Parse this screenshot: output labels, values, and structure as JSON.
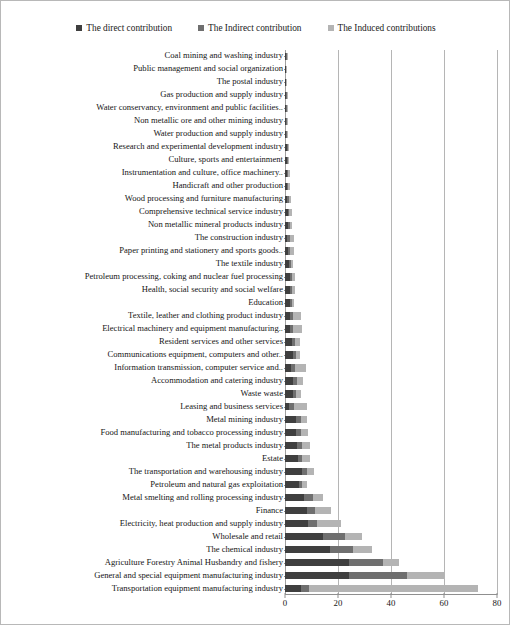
{
  "chart_data": {
    "type": "bar",
    "orientation": "horizontal",
    "stacked": true,
    "title": "",
    "xlabel": "",
    "ylabel": "",
    "xlim": [
      0,
      80
    ],
    "xticks": [
      0,
      20,
      40,
      60,
      80
    ],
    "grid": true,
    "legend_position": "top-center",
    "colors": {
      "direct": "#3f3f3f",
      "indirect": "#6f6f6f",
      "induced": "#b4b4b4",
      "gridline": "#b5b5b5",
      "axis": "#8f8f8f",
      "text": "#161616",
      "background": "#ffffff",
      "border": "#b8b8b8"
    },
    "series": [
      {
        "name": "The direct contribution",
        "key": "direct"
      },
      {
        "name": "The Indirect contribution",
        "key": "indirect"
      },
      {
        "name": "The Induced contributions",
        "key": "induced"
      }
    ],
    "categories": [
      "Coal mining and washing industry",
      "Public management and social organization",
      "The postal industry",
      "Gas production and supply industry",
      "Water conservancy, environment and public facilities..",
      "Non metallic ore and other mining industry",
      "Water production and supply industry",
      "Research and experimental development industry",
      "Culture, sports and entertainment",
      "Instrumentation and culture, office machinery..",
      "Handicraft and other production",
      "Wood processing and furniture manufacturing",
      "Comprehensive technical service industry",
      "Non metallic mineral products industry",
      "The construction industry",
      "Paper printing and stationery and sports goods..",
      "The textile industry",
      "Petroleum processing, coking and nuclear fuel processing",
      "Health, social security and social welfare",
      "Education",
      "Textile, leather and clothing product industry",
      "Electrical machinery and equipment manufacturing..",
      "Resident services and other services",
      "Communications equipment, computers and other..",
      "Information transmission, computer service and..",
      "Accommodation and catering industry",
      "Waste waste",
      "Leasing and business services",
      "Metal mining industry",
      "Food manufacturing and tobacco processing industry",
      "The metal products industry",
      "Estate",
      "The transportation and warehousing industry",
      "Petroleum and natural gas exploitation",
      "Metal smelting and rolling processing industry",
      "Finance",
      "Electricity, heat production and supply industry",
      "Wholesale and retail",
      "The chemical industry",
      "Agriculture Forestry Animal Husbandry and fishery",
      "General and special equipment manufacturing industry",
      "Transportation equipment manufacturing industry"
    ],
    "values": {
      "direct": [
        0.4,
        0.3,
        0.3,
        0.4,
        0.4,
        0.5,
        0.5,
        0.6,
        0.6,
        0.7,
        0.8,
        0.9,
        1.0,
        1.1,
        0.9,
        1.2,
        1.6,
        1.7,
        1.8,
        1.9,
        1.8,
        1.8,
        2.6,
        3.0,
        2.2,
        3.0,
        3.2,
        1.4,
        4.2,
        4.0,
        4.6,
        5.0,
        6.4,
        5.2,
        7.0,
        8.2,
        8.6,
        14.5,
        17.0,
        24.0,
        24.0,
        6.0
      ],
      "indirect": [
        0.2,
        0.2,
        0.2,
        0.2,
        0.3,
        0.3,
        0.3,
        0.4,
        0.5,
        0.5,
        0.5,
        0.6,
        0.6,
        0.7,
        0.9,
        0.8,
        0.7,
        0.9,
        0.8,
        0.6,
        1.1,
        1.3,
        1.0,
        1.2,
        1.6,
        1.4,
        1.0,
        2.0,
        1.8,
        2.2,
        2.0,
        1.6,
        2.0,
        1.2,
        3.6,
        3.2,
        3.6,
        8.0,
        8.6,
        13.0,
        22.0,
        3.0
      ],
      "induced": [
        0.2,
        0.2,
        0.2,
        0.3,
        0.4,
        0.4,
        0.5,
        0.5,
        0.6,
        0.7,
        0.7,
        0.8,
        0.9,
        1.0,
        1.6,
        1.3,
        0.9,
        1.0,
        1.1,
        0.9,
        3.0,
        3.2,
        2.0,
        1.6,
        4.0,
        2.4,
        2.0,
        4.8,
        2.4,
        2.6,
        2.8,
        3.0,
        2.6,
        1.8,
        3.6,
        6.0,
        9.0,
        6.5,
        7.4,
        6.0,
        14.0,
        64.0
      ]
    }
  }
}
